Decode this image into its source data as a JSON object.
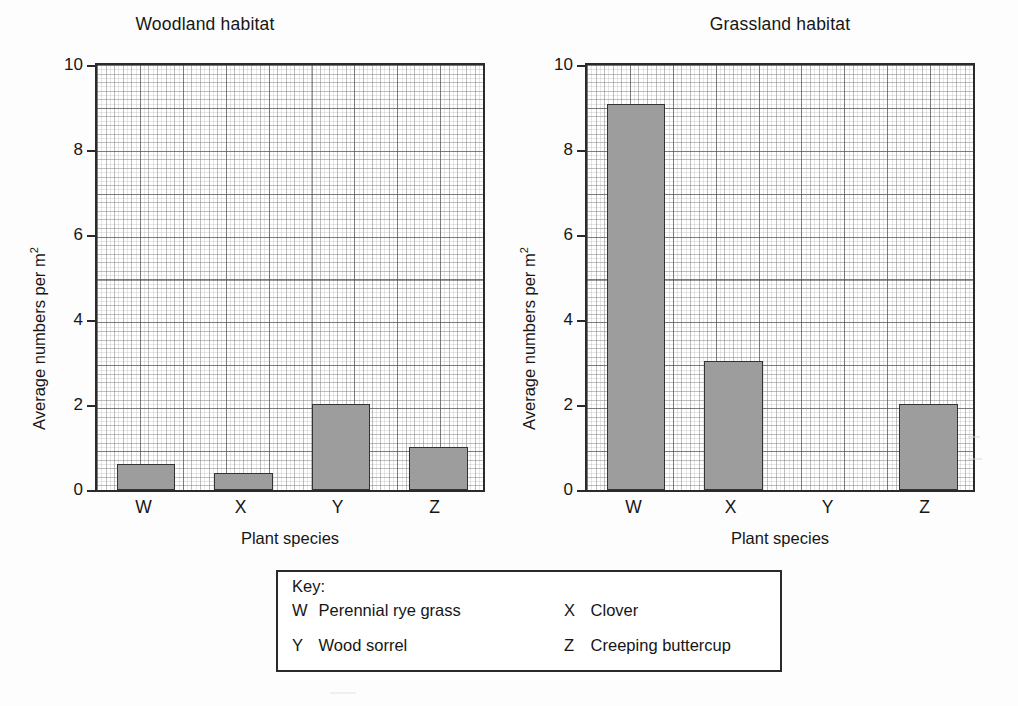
{
  "chart_data": [
    {
      "type": "bar",
      "title": "Woodland habitat",
      "xlabel": "Plant species",
      "ylabel": "Average numbers per m2",
      "ylabel_base": "Average numbers per m",
      "ylabel_sup": "2",
      "categories": [
        "W",
        "X",
        "Y",
        "Z"
      ],
      "values": [
        0.6,
        0.4,
        2.0,
        1.0
      ],
      "ylim": [
        0,
        10
      ],
      "yticks": [
        0,
        2,
        4,
        6,
        8,
        10
      ],
      "grid": true,
      "legend_position": "below-both-charts",
      "bar_fill": "#9d9d9d",
      "bar_stroke": "#333333"
    },
    {
      "type": "bar",
      "title": "Grassland habitat",
      "xlabel": "Plant species",
      "ylabel": "Average numbers per m2",
      "ylabel_base": "Average numbers per m",
      "ylabel_sup": "2",
      "categories": [
        "W",
        "X",
        "Y",
        "Z"
      ],
      "values": [
        9.0,
        3.0,
        0.0,
        2.0
      ],
      "ylim": [
        0,
        10
      ],
      "yticks": [
        0,
        2,
        4,
        6,
        8,
        10
      ],
      "grid": true,
      "legend_position": "below-both-charts",
      "bar_fill": "#9d9d9d",
      "bar_stroke": "#333333"
    }
  ],
  "woodland": {
    "title": "Woodland habitat",
    "xlabel": "Plant species",
    "ylabel_base": "Average numbers per m",
    "ylabel_sup": "2",
    "yticks": [
      "10",
      "8",
      "6",
      "4",
      "2",
      "0"
    ],
    "xticks": [
      "W",
      "X",
      "Y",
      "Z"
    ]
  },
  "grassland": {
    "title": "Grassland habitat",
    "xlabel": "Plant species",
    "ylabel_base": "Average numbers per m",
    "ylabel_sup": "2",
    "yticks": [
      "10",
      "8",
      "6",
      "4",
      "2",
      "0"
    ],
    "xticks": [
      "W",
      "X",
      "Y",
      "Z"
    ]
  },
  "key": {
    "title": "Key:",
    "entries": [
      {
        "code": "W",
        "name": "Perennial rye grass"
      },
      {
        "code": "X",
        "name": "Clover"
      },
      {
        "code": "Y",
        "name": "Wood sorrel"
      },
      {
        "code": "Z",
        "name": "Creeping buttercup"
      }
    ]
  }
}
